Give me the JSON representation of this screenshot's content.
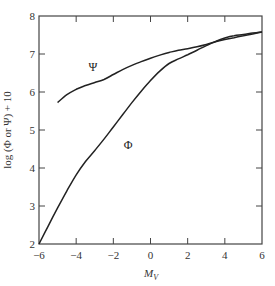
{
  "chart_data": {
    "type": "line",
    "title": "",
    "xlabel": "M_V",
    "xlabel_main": "M",
    "xlabel_sub": "V",
    "ylabel": "log (Φ or Ψ) + 10",
    "xlim": [
      -6,
      6
    ],
    "ylim": [
      2,
      8
    ],
    "xticks": [
      -6,
      -4,
      -2,
      0,
      2,
      4,
      6
    ],
    "xtick_labels": [
      "−6",
      "−4",
      "−2",
      "0",
      "2",
      "4",
      "6"
    ],
    "yticks": [
      2,
      3,
      4,
      5,
      6,
      7,
      8
    ],
    "ytick_labels": [
      "2",
      "3",
      "4",
      "5",
      "6",
      "7",
      "8"
    ],
    "grid": false,
    "legend": "none (inline curve labels)",
    "series": [
      {
        "name": "Ψ",
        "label_pos": [
          -3.1,
          6.55
        ],
        "x": [
          -5.0,
          -4.5,
          -4.0,
          -3.5,
          -3.0,
          -2.5,
          -2.0,
          -1.5,
          -1.0,
          -0.5,
          0.0,
          0.5,
          1.0,
          1.5,
          2.0,
          2.5,
          3.0,
          3.5,
          4.0,
          4.5,
          5.0,
          5.5,
          6.0
        ],
        "values": [
          5.72,
          5.93,
          6.07,
          6.17,
          6.25,
          6.33,
          6.46,
          6.59,
          6.7,
          6.8,
          6.89,
          6.97,
          7.04,
          7.1,
          7.14,
          7.19,
          7.25,
          7.32,
          7.38,
          7.43,
          7.48,
          7.53,
          7.58
        ]
      },
      {
        "name": "Φ",
        "label_pos": [
          -1.2,
          4.5
        ],
        "x": [
          -6.0,
          -5.5,
          -5.0,
          -4.5,
          -4.0,
          -3.5,
          -3.0,
          -2.5,
          -2.0,
          -1.5,
          -1.0,
          -0.5,
          0.0,
          0.5,
          1.0,
          1.5,
          2.0,
          2.5,
          3.0,
          3.5,
          4.0,
          4.5,
          5.0,
          5.5,
          6.0
        ],
        "values": [
          2.0,
          2.48,
          2.95,
          3.4,
          3.82,
          4.17,
          4.46,
          4.76,
          5.08,
          5.4,
          5.72,
          6.02,
          6.3,
          6.55,
          6.75,
          6.87,
          6.98,
          7.1,
          7.22,
          7.33,
          7.42,
          7.48,
          7.51,
          7.55,
          7.58
        ]
      }
    ]
  }
}
